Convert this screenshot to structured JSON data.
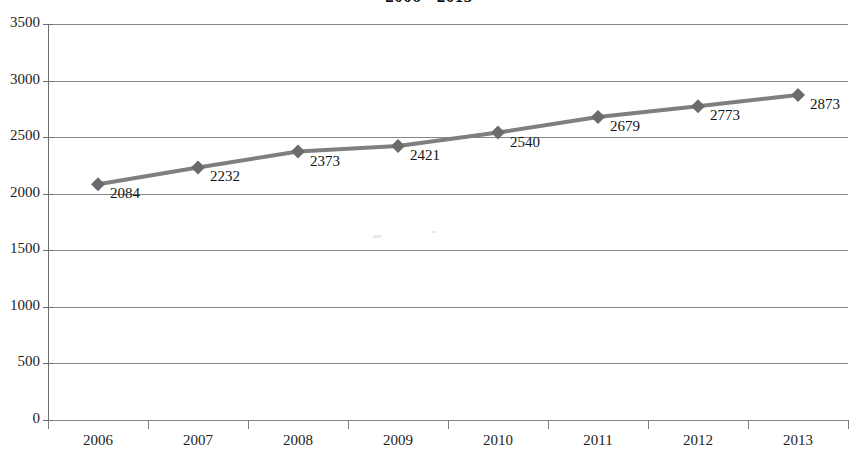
{
  "chart_data": {
    "type": "line",
    "title": "2006 - 2013",
    "xlabel": "",
    "ylabel": "",
    "categories": [
      "2006",
      "2007",
      "2008",
      "2009",
      "2010",
      "2011",
      "2012",
      "2013"
    ],
    "values": [
      2084,
      2232,
      2373,
      2421,
      2540,
      2679,
      2773,
      2873
    ],
    "series": [
      {
        "name": "Series 1",
        "values": [
          2084,
          2232,
          2373,
          2421,
          2540,
          2679,
          2773,
          2873
        ]
      }
    ],
    "point_labels": [
      "2084",
      "2232",
      "2373",
      "2421",
      "2540",
      "2679",
      "2773",
      "2873"
    ],
    "ylim": [
      0,
      3500
    ],
    "y_ticks": [
      0,
      500,
      1000,
      1500,
      2000,
      2500,
      3000,
      3500
    ],
    "y_tick_labels": [
      "0",
      "500",
      "1000",
      "1500",
      "2000",
      "2500",
      "3000",
      "3500"
    ],
    "grid": true,
    "legend": false,
    "legend_position": "none",
    "marker": "diamond",
    "colors": {
      "line": "#7f7f7f",
      "marker": "#6b6b6b",
      "grid": "#868686",
      "axis": "#6f6f6f",
      "text": "#1d1d1d",
      "background": "#ffffff"
    }
  }
}
